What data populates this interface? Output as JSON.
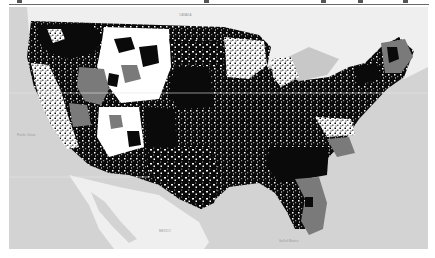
{
  "figure": {
    "type": "choropleth-map",
    "region": "Contiguous United States (county level)",
    "basemap": {
      "ocean_color": "#d3d3d3",
      "land_color": "#f1f1f1",
      "labels_legible": false
    },
    "fill_classes": [
      {
        "name": "class-high",
        "color": "#0a0a0a"
      },
      {
        "name": "class-mid",
        "color": "#7a7a7a"
      },
      {
        "name": "class-low",
        "color": "#ffffff"
      }
    ],
    "top_ticks_x": [
      19,
      206,
      323,
      360,
      405
    ]
  },
  "map_labels": {
    "pacific": "Pacific Ocean",
    "mexico": "MEXICO",
    "gulf": "Gulf of Mexico",
    "canada": "CANADA"
  }
}
